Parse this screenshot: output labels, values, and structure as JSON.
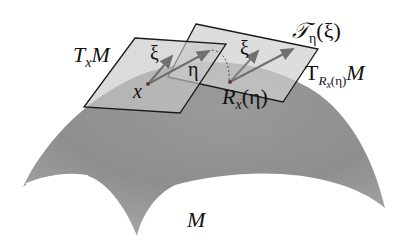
{
  "diagram": {
    "type": "riemannian-retraction-vector-transport",
    "manifold_label": "M",
    "tangent_plane_x": {
      "label_main": "T",
      "label_sub": "x",
      "label_tail": "M"
    },
    "tangent_plane_R": {
      "label_main": "T",
      "label_sub": "R",
      "label_subsub": "x",
      "label_subarg": "(η)",
      "label_tail": "M"
    },
    "point_x": "x",
    "point_R": {
      "main": "R",
      "sub": "x",
      "arg": "(η)"
    },
    "vector_xi_1": "ξ",
    "vector_eta": "η",
    "vector_xi_2": "ξ",
    "transport": {
      "main": "𝒯",
      "sub": "η",
      "arg": "(ξ)"
    },
    "colors": {
      "surface": "#8f8f8f",
      "plane_fill": "#d4d4d4",
      "plane_edge": "#1a1a1a",
      "arrow": "#6e6e6e"
    }
  }
}
